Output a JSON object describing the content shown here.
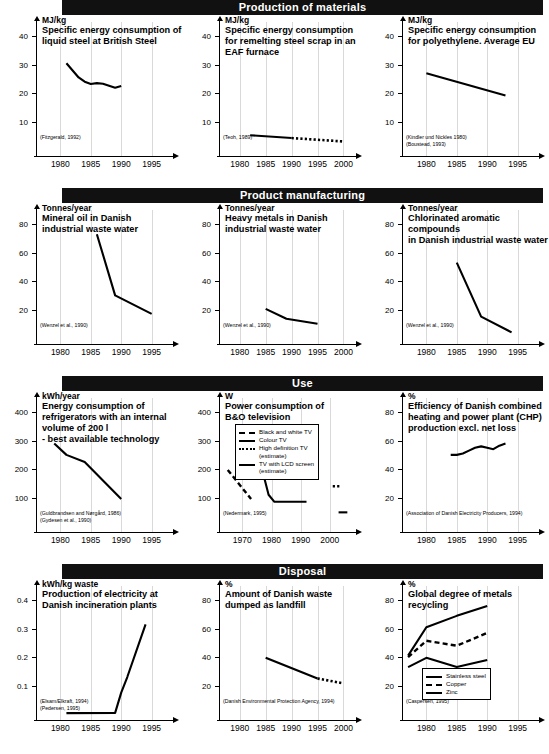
{
  "document": {
    "title": "Environmental improvement trends across product life cycle stages"
  },
  "sections": [
    {
      "banner": "Production of materials",
      "charts": [
        {
          "unit": "MJ/kg",
          "title": "Specific energy consumption of\nliquid steel at British Steel",
          "citations": [
            "(Fitzgerald, 1992)"
          ],
          "chart_data": {
            "type": "line",
            "title": "Specific energy consumption of liquid steel at British Steel",
            "ylabel": "MJ/kg",
            "xlabel": "",
            "ylim": [
              0,
              45
            ],
            "xlim": [
              1976,
              1999
            ],
            "yticks": [
              10,
              20,
              30,
              40
            ],
            "xticks": [
              1980,
              1985,
              1990,
              1995
            ],
            "grid": true,
            "series": [
              {
                "name": "Liquid steel energy",
                "x": [
                  1981,
                  1983,
                  1984,
                  1985,
                  1986,
                  1987,
                  1988,
                  1989,
                  1990
                ],
                "values": [
                  30.5,
                  25.5,
                  24.0,
                  23.2,
                  23.5,
                  23.3,
                  22.6,
                  21.9,
                  22.5
                ]
              }
            ]
          }
        },
        {
          "unit": "MJ/kg",
          "title": "Specific energy consumption\nfor remelting steel scrap in an\nEAF furnace",
          "citations": [
            "(Teoh, 1989)"
          ],
          "chart_data": {
            "type": "line",
            "title": "Specific energy consumption for remelting steel scrap in an EAF furnace",
            "ylabel": "MJ/kg",
            "xlabel": "",
            "ylim": [
              0,
              45
            ],
            "xlim": [
              1976,
              2003
            ],
            "yticks": [
              10,
              20,
              30,
              40
            ],
            "xticks": [
              1980,
              1985,
              1990,
              1995,
              2000
            ],
            "grid": true,
            "series": [
              {
                "name": "EAF remelting (measured)",
                "style": "solid",
                "x": [
                  1982,
                  1990
                ],
                "values": [
                  5.2,
                  4.2
                ]
              },
              {
                "name": "EAF remelting (estimate)",
                "style": "dotted",
                "x": [
                  1990,
                  2000
                ],
                "values": [
                  4.2,
                  3.0
                ]
              }
            ]
          }
        },
        {
          "unit": "MJ/kg",
          "title": "Specific energy consumption\nfor polyethylene. Average EU",
          "citations": [
            "(Kindler und Nickles 1980)",
            "(Boustead, 1993)"
          ],
          "chart_data": {
            "type": "line",
            "title": "Specific energy consumption for polyethylene. Average EU",
            "ylabel": "MJ/kg",
            "xlabel": "",
            "ylim": [
              0,
              45
            ],
            "xlim": [
              1976,
              1999
            ],
            "yticks": [
              10,
              20,
              30,
              40
            ],
            "xticks": [
              1980,
              1985,
              1990,
              1995
            ],
            "grid": true,
            "series": [
              {
                "name": "Polyethylene energy",
                "x": [
                  1980,
                  1993
                ],
                "values": [
                  27.0,
                  19.2
                ]
              }
            ]
          }
        }
      ]
    },
    {
      "banner": "Product manufacturing",
      "charts": [
        {
          "unit": "Tonnes/year",
          "title": "Mineral oil in Danish\nindustrial waste water",
          "citations": [
            "(Wenzel et al., 1990)"
          ],
          "chart_data": {
            "type": "line",
            "title": "Mineral oil in Danish industrial waste water",
            "ylabel": "Tonnes/year",
            "xlabel": "",
            "ylim": [
              0,
              90
            ],
            "xlim": [
              1976,
              1999
            ],
            "yticks": [
              20,
              40,
              60,
              80
            ],
            "xticks": [
              1980,
              1985,
              1990,
              1995
            ],
            "grid": true,
            "series": [
              {
                "name": "Mineral oil",
                "x": [
                  1986,
                  1989,
                  1995
                ],
                "values": [
                  73,
                  30,
                  17
                ]
              }
            ]
          }
        },
        {
          "unit": "Tonnes/year",
          "title": "Heavy metals in Danish\nindustrial waste water",
          "citations": [
            "(Wenzel et al., 1990)"
          ],
          "chart_data": {
            "type": "line",
            "title": "Heavy metals in Danish industrial waste water",
            "ylabel": "Tonnes/year",
            "xlabel": "",
            "ylim": [
              0,
              90
            ],
            "xlim": [
              1976,
              2003
            ],
            "yticks": [
              20,
              40,
              60,
              80
            ],
            "xticks": [
              1980,
              1985,
              1990,
              1995,
              2000
            ],
            "grid": true,
            "series": [
              {
                "name": "Heavy metals",
                "x": [
                  1985,
                  1989,
                  1995
                ],
                "values": [
                  20.5,
                  13.5,
                  10
                ]
              }
            ]
          }
        },
        {
          "unit": "Tonnes/year",
          "title": "Chlorinated aromatic compounds\nin Danish industrial waste water",
          "citations": [
            "(Wenzel et al., 1990)"
          ],
          "chart_data": {
            "type": "line",
            "title": "Chlorinated aromatic compounds in Danish industrial waste water",
            "ylabel": "Tonnes/year",
            "xlabel": "",
            "ylim": [
              0,
              90
            ],
            "xlim": [
              1976,
              1999
            ],
            "yticks": [
              20,
              40,
              60,
              80
            ],
            "xticks": [
              1980,
              1985,
              1990,
              1995
            ],
            "grid": true,
            "series": [
              {
                "name": "Chlorinated aromatic compounds",
                "x": [
                  1985,
                  1989,
                  1994
                ],
                "values": [
                  53,
                  15,
                  4
                ]
              }
            ]
          }
        }
      ]
    },
    {
      "banner": "Use",
      "charts": [
        {
          "unit": "kWh/year",
          "title": "Energy consumption of\nrefrigerators with an internal\nvolume of 200 l\n- best available technology",
          "citations": [
            "(Guldbrandsen and Nørgård, 1986)",
            "(Gydesen et al., 1990)"
          ],
          "chart_data": {
            "type": "line",
            "title": "Energy consumption of refrigerators with an internal volume of 200 l - best available technology",
            "ylabel": "kWh/year",
            "xlabel": "",
            "ylim": [
              0,
              450
            ],
            "xlim": [
              1976,
              1999
            ],
            "yticks": [
              100,
              200,
              300,
              400
            ],
            "xticks": [
              1980,
              1985,
              1990,
              1995
            ],
            "grid": true,
            "series": [
              {
                "name": "Refrigerator consumption",
                "x": [
                  1979,
                  1981,
                  1984,
                  1990
                ],
                "values": [
                  290,
                  250,
                  225,
                  95
                ]
              }
            ]
          }
        },
        {
          "unit": "W",
          "title": "Power consumption of\nB&O television",
          "citations": [
            "(Nedermark, 1995)"
          ],
          "legend": {
            "entries": [
              {
                "label": "Black and white TV",
                "style": "dashed"
              },
              {
                "label": "Colour TV",
                "style": "solid"
              },
              {
                "label": "High definition TV\n(estimate)",
                "style": "dotted"
              },
              {
                "label": "TV with LCD screen\n(estimate)",
                "style": "solid"
              }
            ]
          },
          "chart_data": {
            "type": "line",
            "title": "Power consumption of B&O television",
            "ylabel": "W",
            "xlabel": "",
            "ylim": [
              0,
              450
            ],
            "xlim": [
              1962,
              2010
            ],
            "yticks": [
              100,
              200,
              300,
              400
            ],
            "xticks": [
              1970,
              1980,
              1990,
              2000
            ],
            "grid": true,
            "series": [
              {
                "name": "Black and white TV",
                "style": "dashed",
                "x": [
                  1965,
                  1973
                ],
                "values": [
                  197,
                  95
                ]
              },
              {
                "name": "Colour TV",
                "style": "solid",
                "x": [
                  1973,
                  1979,
                  1981,
                  1992
                ],
                "values": [
                  350,
                  110,
                  85,
                  85
                ]
              },
              {
                "name": "High definition TV (estimate)",
                "style": "dotted",
                "x": [
                  2001,
                  2004
                ],
                "values": [
                  140,
                  140
                ]
              },
              {
                "name": "TV with LCD screen (estimate)",
                "style": "solid",
                "x": [
                  2003,
                  2006
                ],
                "values": [
                  48,
                  48
                ]
              }
            ]
          }
        },
        {
          "unit": "%",
          "title": "Efficiency of Danish combined\nheating and power plant (CHP)\nproduction excl. net loss",
          "citations": [
            "(Association of Danish Electricity Producers, 1994)"
          ],
          "chart_data": {
            "type": "line",
            "title": "Efficiency of Danish combined heating and power plant (CHP) production excl. net loss",
            "ylabel": "%",
            "xlabel": "",
            "ylim": [
              0,
              90
            ],
            "xlim": [
              1976,
              1999
            ],
            "yticks": [
              20,
              40,
              60,
              80
            ],
            "xticks": [
              1980,
              1985,
              1990,
              1995
            ],
            "grid": true,
            "series": [
              {
                "name": "CHP efficiency",
                "x": [
                  1984,
                  1985,
                  1986,
                  1987,
                  1988,
                  1989,
                  1990,
                  1991,
                  1992,
                  1993
                ],
                "values": [
                  50,
                  50,
                  51,
                  53,
                  55,
                  56,
                  55,
                  54,
                  56.5,
                  58
                ]
              }
            ]
          }
        }
      ]
    },
    {
      "banner": "Disposal",
      "charts": [
        {
          "unit": "kWh/kg waste",
          "title": "Production of electricity at\nDanish incineration plants",
          "citations": [
            "(Elsam/Elkraft, 1994)",
            "(Pedersen, 1995)"
          ],
          "chart_data": {
            "type": "line",
            "title": "Production of electricity at Danish incineration plants",
            "ylabel": "kWh/kg waste",
            "xlabel": "",
            "ylim": [
              0,
              0.45
            ],
            "xlim": [
              1976,
              1999
            ],
            "yticks": [
              0.1,
              0.2,
              0.3,
              0.4
            ],
            "xticks": [
              1980,
              1985,
              1990,
              1995
            ],
            "grid": true,
            "series": [
              {
                "name": "Electricity production",
                "x": [
                  1981,
                  1989,
                  1990,
                  1991,
                  1994
                ],
                "values": [
                  0.003,
                  0.004,
                  0.075,
                  0.13,
                  0.315
                ]
              }
            ]
          }
        },
        {
          "unit": "%",
          "title": "Amount of Danish waste\ndumped as landfill",
          "citations": [
            "(Danish Environmental Protection Agency, 1994)"
          ],
          "chart_data": {
            "type": "line",
            "title": "Amount of Danish waste dumped as landfill",
            "ylabel": "%",
            "xlabel": "",
            "ylim": [
              0,
              90
            ],
            "xlim": [
              1976,
              2003
            ],
            "yticks": [
              20,
              40,
              60,
              80
            ],
            "xticks": [
              1980,
              1985,
              1990,
              1995,
              2000
            ],
            "grid": true,
            "series": [
              {
                "name": "Landfill (measured)",
                "style": "solid",
                "x": [
                  1985,
                  1995
                ],
                "values": [
                  39.5,
                  25
                ]
              },
              {
                "name": "Landfill (estimate)",
                "style": "dotted",
                "x": [
                  1995,
                  2000
                ],
                "values": [
                  25,
                  21.5
                ]
              }
            ]
          }
        },
        {
          "unit": "%",
          "title": "Global degree of metals\nrecycling",
          "citations": [
            "(Caspersen, 1995)"
          ],
          "legend": {
            "entries": [
              {
                "label": "Stainless steel",
                "style": "solid"
              },
              {
                "label": "Copper",
                "style": "dashed"
              },
              {
                "label": "Zinc",
                "style": "solid"
              }
            ]
          },
          "chart_data": {
            "type": "line",
            "title": "Global degree of metals recycling",
            "ylabel": "%",
            "xlabel": "",
            "ylim": [
              0,
              90
            ],
            "xlim": [
              1976,
              1999
            ],
            "yticks": [
              20,
              40,
              60,
              80
            ],
            "xticks": [
              1980,
              1985,
              1990,
              1995
            ],
            "grid": true,
            "series": [
              {
                "name": "Stainless steel",
                "style": "solid",
                "x": [
                  1977,
                  1980,
                  1985,
                  1990
                ],
                "values": [
                  41,
                  61,
                  69,
                  76
                ]
              },
              {
                "name": "Copper",
                "style": "dashed",
                "x": [
                  1977,
                  1980,
                  1985,
                  1990
                ],
                "values": [
                  40,
                  51.5,
                  48,
                  57
                ]
              },
              {
                "name": "Zinc",
                "style": "solid",
                "x": [
                  1977,
                  1980,
                  1985,
                  1990
                ],
                "values": [
                  33,
                  39.5,
                  33,
                  38
                ]
              }
            ]
          }
        }
      ]
    }
  ]
}
